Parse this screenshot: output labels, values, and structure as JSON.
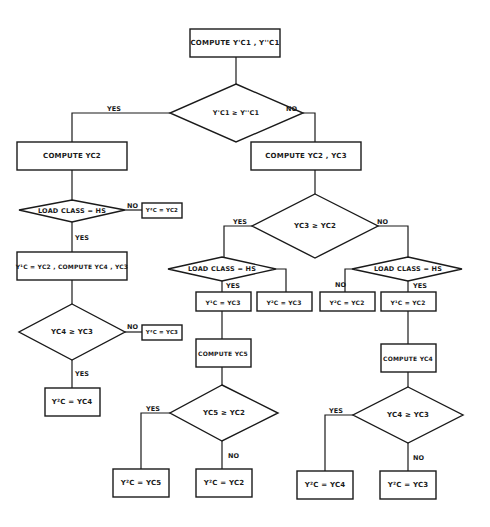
{
  "diagram": {
    "type": "flowchart",
    "nodes": {
      "n1": "COMPUTE Y'C1 , Y''C1",
      "d1": "Y'C1 ≥ Y''C1",
      "n2": "COMPUTE YC2",
      "n3": "COMPUTE YC2 , YC3",
      "d2": "LOAD CLASS = HS",
      "n4": "Y²C = YC2",
      "n5": "Y¹C = YC2 , COMPUTE YC4 , YC3",
      "d3": "YC4 ≥ YC3",
      "n6": "Y²C = YC3",
      "n7": "Y²C = YC4",
      "d4": "YC3 ≥ YC2",
      "d5": "LOAD CLASS = HS",
      "d6": "LOAD CLASS = HS",
      "n8": "Y¹C = YC3",
      "n9": "Y²C = YC3",
      "n10": "Y²C = YC2",
      "n11": "Y¹C = YC2",
      "n12": "COMPUTE YC5",
      "n13": "COMPUTE YC4",
      "d7": "YC5 ≥ YC2",
      "d8": "YC4 ≥ YC3",
      "n14": "Y²C = YC5",
      "n15": "Y²C = YC2",
      "n16": "Y²C = YC4",
      "n17": "Y²C = YC3"
    },
    "edge_labels": {
      "yes": "YES",
      "no": "NO",
      "yes_alt": "YES"
    },
    "colors": {
      "stroke": "#1a1a1a",
      "background": "#ffffff"
    }
  }
}
